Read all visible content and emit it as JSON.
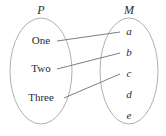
{
  "diagram": {
    "type": "set-mapping-diagram",
    "background_color": "#ffffff",
    "outline_color": "#9a9a9a",
    "line_color": "#6f6f6f",
    "text_color": "#2b2b2b",
    "domain_set": {
      "label": "P",
      "elements": [
        {
          "label": "One",
          "x": 41,
          "y": 44
        },
        {
          "label": "Two",
          "x": 41,
          "y": 72
        },
        {
          "label": "Three",
          "x": 41,
          "y": 101
        }
      ],
      "ellipse": {
        "cx": 41,
        "cy": 71,
        "rx": 31,
        "ry": 53
      }
    },
    "codomain_set": {
      "label": "M",
      "elements": [
        {
          "label": "a",
          "x": 129,
          "y": 35
        },
        {
          "label": "b",
          "x": 129,
          "y": 56
        },
        {
          "label": "c",
          "x": 129,
          "y": 77
        },
        {
          "label": "d",
          "x": 129,
          "y": 98
        },
        {
          "label": "e",
          "x": 129,
          "y": 119
        }
      ],
      "ellipse": {
        "cx": 129,
        "cy": 71,
        "rx": 29,
        "ry": 53
      }
    },
    "mappings": [
      {
        "from": "One",
        "to": "a",
        "x1": 57,
        "y1": 41,
        "x2": 120,
        "y2": 32
      },
      {
        "from": "Two",
        "to": "b",
        "x1": 57,
        "y1": 69,
        "x2": 120,
        "y2": 53
      },
      {
        "from": "Three",
        "to": "c",
        "x1": 64,
        "y1": 98,
        "x2": 120,
        "y2": 74
      }
    ],
    "unmapped_codomain_elements": [
      "d",
      "e"
    ]
  }
}
